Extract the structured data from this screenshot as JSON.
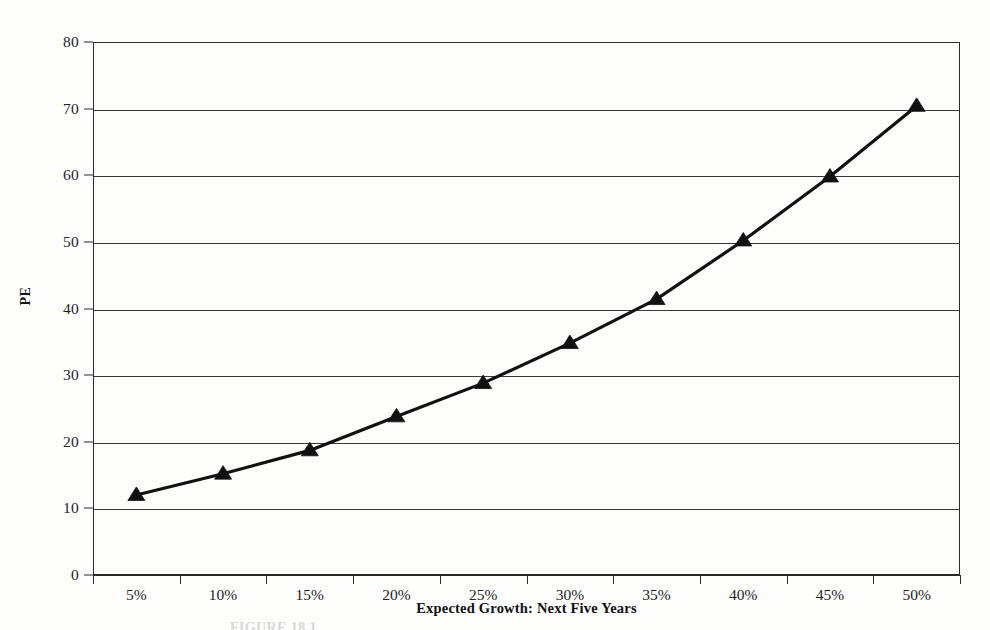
{
  "figure": {
    "background_color": "#fdfdfc",
    "ink_color": "#1a1a1a",
    "caption_partial": "FIGURE 18.1"
  },
  "chart_data": {
    "type": "line",
    "title": "",
    "subtitle": "",
    "xlabel": "Expected Growth: Next Five Years",
    "ylabel": "PE",
    "categories": [
      "5%",
      "10%",
      "15%",
      "20%",
      "25%",
      "30%",
      "35%",
      "40%",
      "45%",
      "50%"
    ],
    "values": [
      12.0,
      15.2,
      18.7,
      23.8,
      28.8,
      34.8,
      41.4,
      50.2,
      59.8,
      70.4
    ],
    "series": [
      {
        "name": "PE",
        "values": [
          12.0,
          15.2,
          18.7,
          23.8,
          28.8,
          34.8,
          41.4,
          50.2,
          59.8,
          70.4
        ],
        "marker": "triangle",
        "marker_color": "#111111",
        "line_color": "#111111"
      }
    ],
    "ylim": [
      0,
      80
    ],
    "yticks": [
      0,
      10,
      20,
      30,
      40,
      50,
      60,
      70,
      80
    ],
    "ytick_labels": [
      "0",
      "10",
      "20",
      "30",
      "40",
      "50",
      "60",
      "70",
      "80"
    ],
    "grid": true,
    "grid_axis": "y",
    "legend": false,
    "legend_position": "none"
  }
}
